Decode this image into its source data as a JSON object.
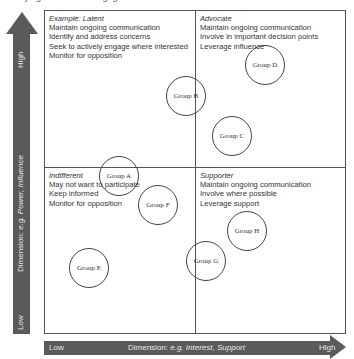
{
  "cropped_header": "Identifying stakeholder engagement",
  "quadrants": {
    "top_left": {
      "title": "Example: Latent",
      "lines": [
        "Maintain ongoing communication",
        "Identify and address concerns",
        "Seek to actively engage where interested",
        "Monitor for opposition"
      ]
    },
    "top_right": {
      "title": "Advocate",
      "lines": [
        "Maintain ongoing communication",
        "Involve in important decision points",
        "Leverage influence"
      ]
    },
    "bottom_left": {
      "title": "Indifferent",
      "lines": [
        "May not want to participate",
        "Keep informed",
        "Monitor for opposition"
      ]
    },
    "bottom_right": {
      "title": "Supporter",
      "lines": [
        "Maintain ongoing communication",
        "Involve where possible",
        "Leverage support"
      ]
    }
  },
  "groups": [
    {
      "label": "Group A",
      "x": 119,
      "y": 176
    },
    {
      "label": "Group B",
      "x": 186,
      "y": 96
    },
    {
      "label": "Group C",
      "x": 232,
      "y": 136
    },
    {
      "label": "Group D",
      "x": 265,
      "y": 65
    },
    {
      "label": "Group E",
      "x": 89,
      "y": 268
    },
    {
      "label": "Group F",
      "x": 158,
      "y": 205
    },
    {
      "label": "Group G",
      "x": 206,
      "y": 261
    },
    {
      "label": "Group H",
      "x": 247,
      "y": 231
    }
  ],
  "y_axis": {
    "high": "High",
    "low": "Low",
    "label_prefix": "Dimension: ",
    "label_example": "e.g. Power, Influence"
  },
  "x_axis": {
    "low": "Low",
    "high": "High",
    "label_prefix": "Dimension: ",
    "label_example": "e.g. Interest, Support"
  }
}
